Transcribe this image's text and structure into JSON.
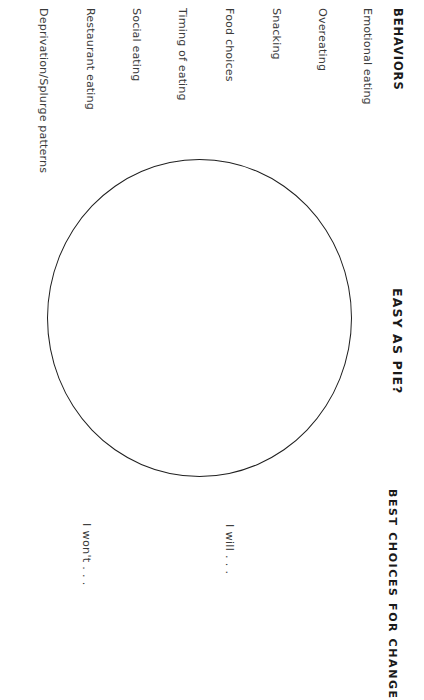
{
  "page": {
    "title": "EASY AS PIE?",
    "background_color": "#ffffff",
    "ink_color": "#2b2b2b",
    "orientation": "rotated-90-clockwise"
  },
  "behaviors_section": {
    "heading": "BEHAVIORS",
    "items": [
      {
        "label": "Emotional eating"
      },
      {
        "label": "Overeating"
      },
      {
        "label": "Snacking"
      },
      {
        "label": "Food choices"
      },
      {
        "label": "Timing of eating"
      },
      {
        "label": "Social eating"
      },
      {
        "label": "Restaurant eating"
      },
      {
        "label": "Deprivation/Splurge patterns"
      }
    ]
  },
  "choices_section": {
    "heading": "BEST CHOICES FOR CHANGE",
    "prompts": [
      {
        "label": "I will . . ."
      },
      {
        "label": "I won't . . ."
      }
    ]
  },
  "pie_chart": {
    "shape_name": "empty-pie-circle",
    "stroke_color": "#1f1f1f",
    "fill_color": "transparent",
    "diameter_px": 305
  }
}
